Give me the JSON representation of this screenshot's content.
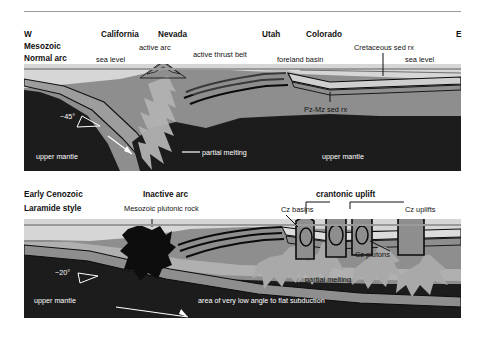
{
  "figure": {
    "title_present": false,
    "panels": [
      {
        "id": "mesozoic-normal-arc",
        "corner_labels": {
          "west": "W",
          "east": "E"
        },
        "stage_line1": "Mesozoic",
        "stage_line2": "Normal arc",
        "state_labels": [
          "California",
          "Nevada",
          "Utah",
          "Colorado"
        ],
        "annotations": {
          "active_arc": "active arc",
          "sea_level_left": "sea level",
          "sea_level_right": "sea level",
          "active_thrust_belt": "active thrust belt",
          "foreland_basin": "foreland basin",
          "cretaceous_sed_rx": "Cretaceous sed rx",
          "pz_mz_sed_rx": "Pz-Mz sed rx",
          "subduction_angle": "~45°",
          "upper_mantle_left": "upper mantle",
          "upper_mantle_right": "upper mantle",
          "partial_melting": "partial melting"
        }
      },
      {
        "id": "early-cenozoic-laramide",
        "stage_line1": "Early Cenozoic",
        "stage_line2": "Laramide style",
        "annotations": {
          "inactive_arc": "Inactive arc",
          "mesozoic_plutonic_rock": "Mesozoic plutonic rock",
          "sea_level": "sea level",
          "cratonic_uplift": "crantonic uplift",
          "cz_basins": "Cz basins",
          "cz_uplifts": "Cz uplifts",
          "cz_plutons": "Cz plutons",
          "partial_melting": "partial melting",
          "subduction_angle": "~20°",
          "upper_mantle": "upper mantle",
          "flat_subduction": "area of very low angle to flat subduction"
        }
      }
    ]
  },
  "colors": {
    "background": "#ffffff",
    "mantle_dark": "#1c1c1c",
    "crust_mid_gray": "#8e8e8e",
    "crust_light_gray": "#b9b9b9",
    "sediment_pale": "#d3d3d3",
    "magma_light": "#a9a9a9",
    "pluton_black": "#0d0d0d",
    "sea_level_line": "#9a9a9a",
    "rule": "#9a9a9a",
    "text_dark": "#111111",
    "text_light": "#ffffff"
  }
}
